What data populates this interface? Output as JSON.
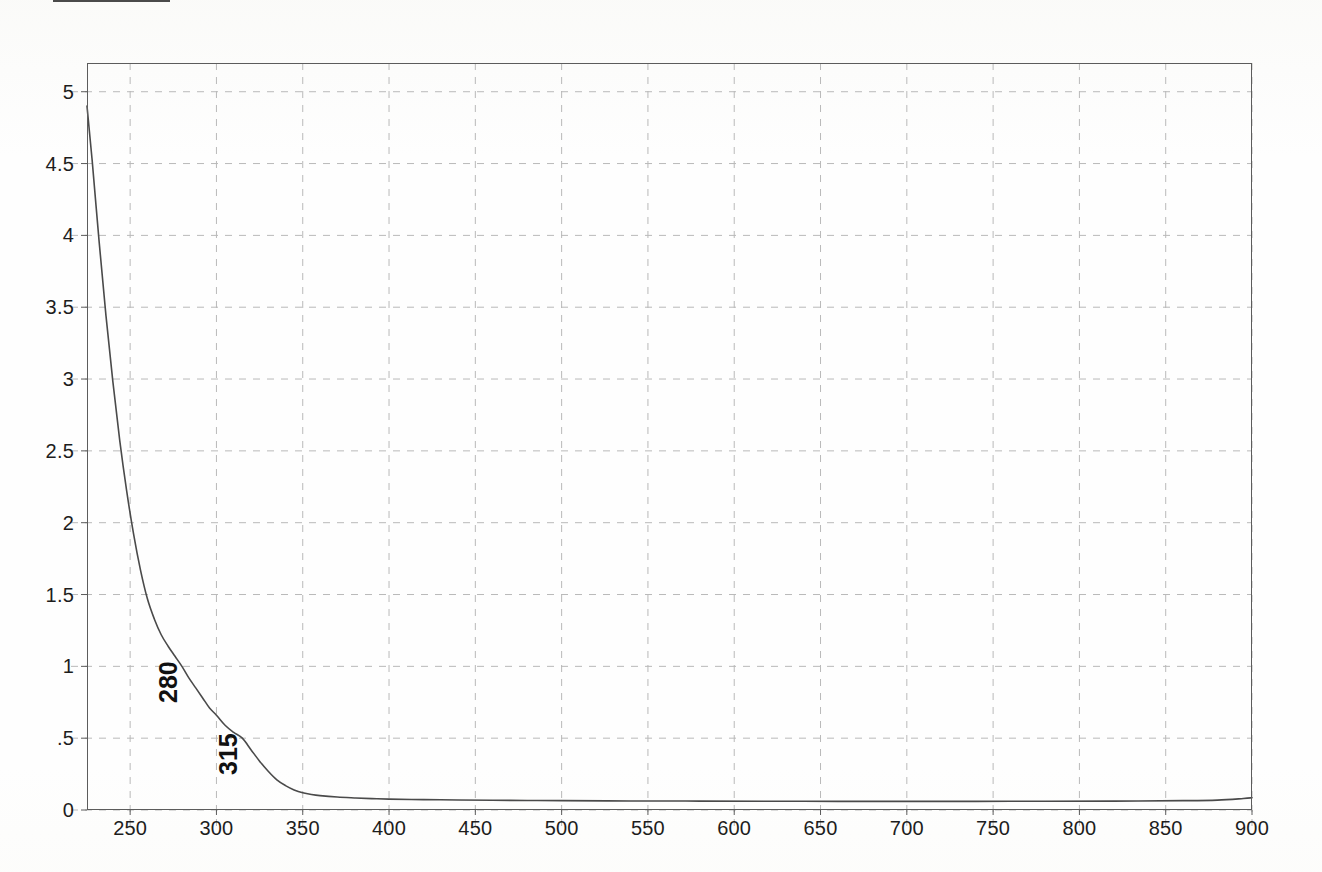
{
  "document": {
    "kind": "scanned-uv-vis-spectrum",
    "top_clipped_box": ""
  },
  "chart_data": {
    "type": "line",
    "title": "",
    "subtitle": "",
    "xlabel": "",
    "ylabel": "",
    "xlim": [
      225,
      900
    ],
    "ylim": [
      0,
      5.2
    ],
    "grid": true,
    "legend": "none",
    "xticks": [
      250,
      300,
      350,
      400,
      450,
      500,
      550,
      600,
      650,
      700,
      750,
      800,
      850,
      900
    ],
    "xtick_labels": [
      "250",
      "300",
      "350",
      "400",
      "450",
      "500",
      "550",
      "600",
      "650",
      "700",
      "750",
      "800",
      "850",
      "900"
    ],
    "yticks": [
      0,
      0.5,
      1,
      1.5,
      2,
      2.5,
      3,
      3.5,
      4,
      4.5,
      5
    ],
    "ytick_labels": [
      "0",
      ".5",
      "1",
      "1.5",
      "2",
      "2.5",
      "3",
      "3.5",
      "4",
      "4.5",
      "5"
    ],
    "series": [
      {
        "name": "absorbance",
        "color": "#4a4a4a",
        "x": [
          225,
          228,
          232,
          236,
          240,
          244,
          248,
          252,
          256,
          260,
          264,
          268,
          272,
          276,
          280,
          284,
          288,
          292,
          296,
          300,
          305,
          310,
          315,
          320,
          325,
          330,
          335,
          340,
          345,
          350,
          355,
          360,
          370,
          380,
          390,
          400,
          420,
          440,
          460,
          480,
          500,
          540,
          580,
          620,
          660,
          700,
          740,
          780,
          820,
          860,
          880,
          895,
          900
        ],
        "y": [
          4.9,
          4.52,
          3.96,
          3.44,
          2.98,
          2.57,
          2.22,
          1.92,
          1.67,
          1.47,
          1.33,
          1.22,
          1.14,
          1.07,
          1.0,
          0.92,
          0.85,
          0.78,
          0.71,
          0.66,
          0.59,
          0.54,
          0.5,
          0.42,
          0.34,
          0.27,
          0.21,
          0.17,
          0.14,
          0.12,
          0.108,
          0.1,
          0.09,
          0.084,
          0.079,
          0.076,
          0.072,
          0.07,
          0.068,
          0.066,
          0.065,
          0.063,
          0.062,
          0.061,
          0.06,
          0.06,
          0.06,
          0.061,
          0.062,
          0.065,
          0.069,
          0.08,
          0.085
        ]
      }
    ],
    "annotations": [
      {
        "label": "280",
        "x": 280,
        "y": 1.0,
        "rotation": -90
      },
      {
        "label": "315",
        "x": 315,
        "y": 0.5,
        "rotation": -90
      }
    ]
  },
  "style": {
    "grid_color": "#b9b9b9",
    "frame_color": "#5c5c5c",
    "curve_color": "#4a4a4a",
    "text_color": "#1d1d1d",
    "background": "#ffffff"
  }
}
